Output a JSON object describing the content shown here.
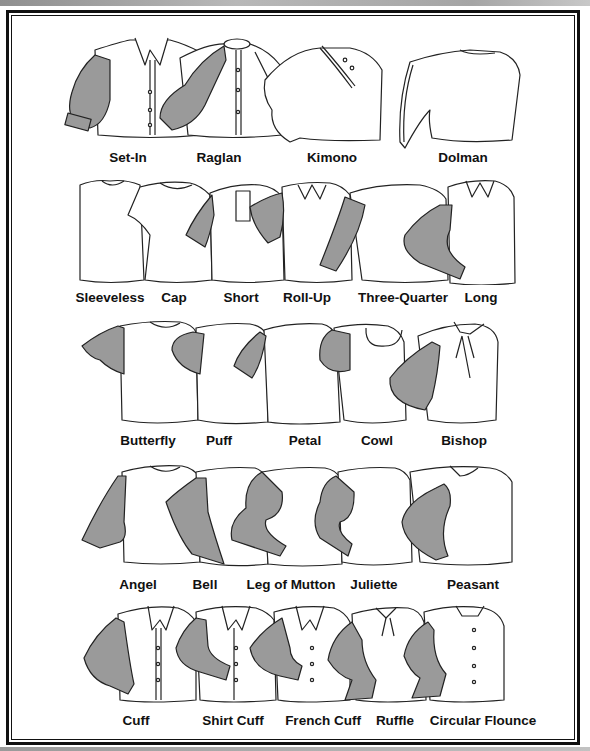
{
  "colors": {
    "sleeve_fill": "#9a9a9a",
    "outline": "#222222",
    "frame": "#111111",
    "background": "#ffffff"
  },
  "rows": [
    {
      "items": [
        {
          "label": "Set-In",
          "x": 128,
          "shaded": true
        },
        {
          "label": "Raglan",
          "x": 219,
          "shaded": true
        },
        {
          "label": "Kimono",
          "x": 332,
          "shaded": false
        },
        {
          "label": "Dolman",
          "x": 463,
          "shaded": false
        }
      ]
    },
    {
      "items": [
        {
          "label": "Sleeveless",
          "x": 110,
          "shaded": false
        },
        {
          "label": "Cap",
          "x": 174,
          "shaded": false
        },
        {
          "label": "Short",
          "x": 241,
          "shaded": true
        },
        {
          "label": "Roll-Up",
          "x": 307,
          "shaded": true
        },
        {
          "label": "Three-Quarter",
          "x": 403,
          "shaded": true
        },
        {
          "label": "Long",
          "x": 481,
          "shaded": true
        }
      ]
    },
    {
      "items": [
        {
          "label": "Butterfly",
          "x": 148,
          "shaded": true
        },
        {
          "label": "Puff",
          "x": 219,
          "shaded": true
        },
        {
          "label": "Petal",
          "x": 305,
          "shaded": true
        },
        {
          "label": "Cowl",
          "x": 377,
          "shaded": true
        },
        {
          "label": "Bishop",
          "x": 464,
          "shaded": true
        }
      ]
    },
    {
      "items": [
        {
          "label": "Angel",
          "x": 138,
          "shaded": true
        },
        {
          "label": "Bell",
          "x": 205,
          "shaded": true
        },
        {
          "label": "Leg of Mutton",
          "x": 291,
          "shaded": true
        },
        {
          "label": "Juliette",
          "x": 374,
          "shaded": true
        },
        {
          "label": "Peasant",
          "x": 473,
          "shaded": true
        }
      ]
    },
    {
      "items": [
        {
          "label": "Cuff",
          "x": 136,
          "shaded": true
        },
        {
          "label": "Shirt Cuff",
          "x": 233,
          "shaded": true
        },
        {
          "label": "French Cuff",
          "x": 323,
          "shaded": true
        },
        {
          "label": "Ruffle",
          "x": 395,
          "shaded": true
        },
        {
          "label": "Circular Flounce",
          "x": 483,
          "shaded": true
        }
      ]
    }
  ]
}
